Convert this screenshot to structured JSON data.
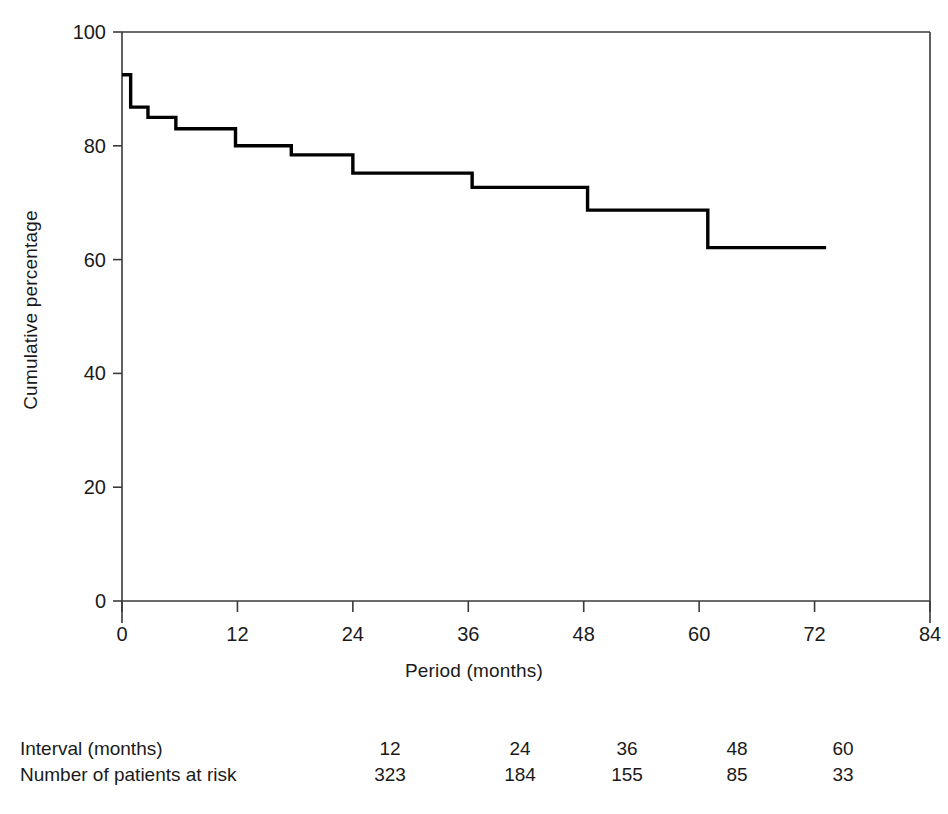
{
  "chart_data": {
    "type": "line",
    "subtype": "kaplan-meier-step",
    "title": "",
    "xlabel": "Period (months)",
    "ylabel": "Cumulative percentage",
    "xlim": [
      0,
      84
    ],
    "ylim": [
      0,
      100
    ],
    "xticks": [
      0,
      12,
      24,
      36,
      48,
      60,
      72,
      84
    ],
    "xticklabels": [
      "0",
      "12",
      "24",
      "36",
      "48",
      "60",
      "72",
      "84"
    ],
    "yticks": [
      0,
      20,
      40,
      60,
      80,
      100
    ],
    "yticklabels": [
      "0",
      "20",
      "40",
      "60",
      "80",
      "100"
    ],
    "grid": false,
    "legend": null,
    "line_color": "#000000",
    "series": [
      {
        "name": "Cumulative survival",
        "x": [
          0,
          0.9,
          0.9,
          2.7,
          2.7,
          5.6,
          5.6,
          11.8,
          11.8,
          17.6,
          17.6,
          24.0,
          24.0,
          36.4,
          36.4,
          48.4,
          48.4,
          60.9,
          60.9,
          73.2
        ],
        "y": [
          92.5,
          92.5,
          86.8,
          86.8,
          85.0,
          85.0,
          83.0,
          83.0,
          80.0,
          80.0,
          78.4,
          78.4,
          75.2,
          75.2,
          72.7,
          72.7,
          68.7,
          68.7,
          62.1,
          62.1
        ]
      }
    ],
    "step_points": [
      {
        "month": 0.0,
        "value": 92.5
      },
      {
        "month": 0.9,
        "value": 86.8
      },
      {
        "month": 2.7,
        "value": 85.0
      },
      {
        "month": 5.6,
        "value": 83.0
      },
      {
        "month": 11.8,
        "value": 80.0
      },
      {
        "month": 17.6,
        "value": 78.4
      },
      {
        "month": 24.0,
        "value": 75.2
      },
      {
        "month": 36.4,
        "value": 72.7
      },
      {
        "month": 48.4,
        "value": 68.7
      },
      {
        "month": 60.9,
        "value": 62.1
      },
      {
        "month": 73.2,
        "value": 62.1
      }
    ]
  },
  "risk_table": {
    "row_labels": [
      "Interval (months)",
      "Number of patients at risk"
    ],
    "intervals": [
      "12",
      "24",
      "36",
      "48",
      "60"
    ],
    "at_risk": [
      "323",
      "184",
      "155",
      "85",
      "33"
    ]
  }
}
